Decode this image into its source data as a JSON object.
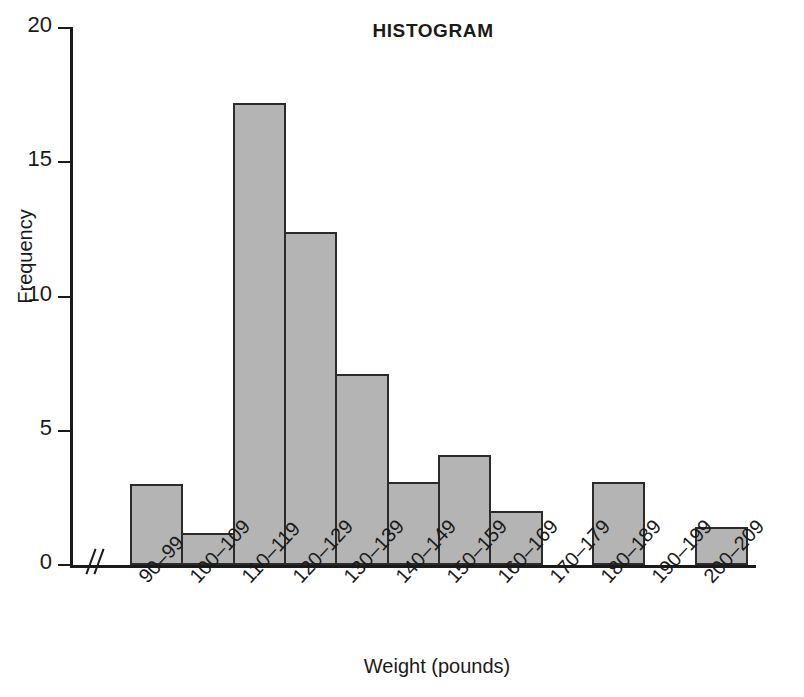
{
  "chart_data": {
    "type": "bar",
    "title": "HISTOGRAM",
    "xlabel": "Weight (pounds)",
    "ylabel": "Frequency",
    "categories": [
      "90–99",
      "100–109",
      "110–119",
      "120–129",
      "130–139",
      "140–149",
      "150–159",
      "160–169",
      "170–179",
      "180–189",
      "190–199",
      "200–209"
    ],
    "values": [
      3,
      1.2,
      17.2,
      12.4,
      7.1,
      3.1,
      4.1,
      2,
      0,
      3.1,
      0,
      1.4
    ],
    "ylim": [
      0,
      20
    ],
    "yticks": [
      0,
      5,
      10,
      15,
      20
    ],
    "ytick_labels": [
      "0",
      "5",
      "10",
      "15",
      "20"
    ],
    "grid": false,
    "legend": null,
    "axis_break": "x-axis break between origin and first bar",
    "bar_fill_color": "#b4b4b4",
    "bar_edge_color": "#2b2b2b",
    "axis_color": "#1a1a1a"
  }
}
